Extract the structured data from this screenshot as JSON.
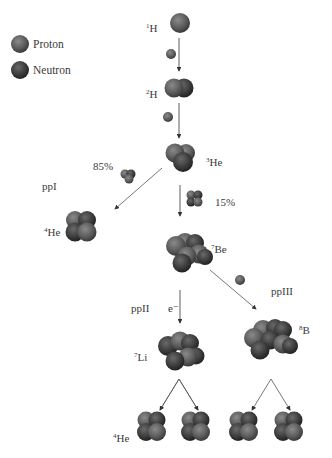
{
  "legend": {
    "items": [
      {
        "label": "Proton",
        "color": "#6e6e6e"
      },
      {
        "label": "Neutron",
        "color": "#4a4a4a"
      }
    ]
  },
  "nuclei": {
    "h1": {
      "mass": "1",
      "symbol": "H"
    },
    "h2": {
      "mass": "2",
      "symbol": "H"
    },
    "he3": {
      "mass": "3",
      "symbol": "He"
    },
    "he4_ppI": {
      "mass": "4",
      "symbol": "He"
    },
    "be7": {
      "mass": "7",
      "symbol": "Be"
    },
    "li7": {
      "mass": "7",
      "symbol": "Li"
    },
    "b8": {
      "mass": "8",
      "symbol": "B"
    },
    "he4_final": {
      "mass": "4",
      "symbol": "He"
    }
  },
  "branches": {
    "ppI": {
      "label": "ppI",
      "percent": "85%"
    },
    "ppII": {
      "label": "ppII",
      "percent": "15%",
      "particle": "e⁻"
    },
    "ppIII": {
      "label": "ppIII"
    }
  }
}
